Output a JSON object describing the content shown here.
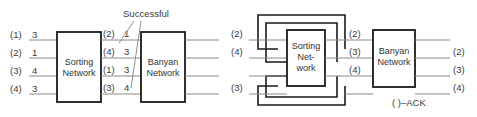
{
  "figure": {
    "name": "sorting-banyan-network-diagram",
    "panels": [
      {
        "id": "left-panel",
        "name": "non-blocking-successful-routing",
        "callout": "Successful",
        "blocks": [
          {
            "id": "sorting",
            "name": "sorting-network-block",
            "lines": [
              "Sorting",
              "Network"
            ]
          },
          {
            "id": "banyan",
            "name": "banyan-network-block",
            "lines": [
              "Banyan",
              "Network"
            ]
          }
        ],
        "input_labels": [
          {
            "port": "(1)",
            "value": "3"
          },
          {
            "port": "(2)",
            "value": "1"
          },
          {
            "port": "(3)",
            "value": "4"
          },
          {
            "port": "(4)",
            "value": "3"
          }
        ],
        "middle_labels": [
          {
            "port": "(2)",
            "value": "1"
          },
          {
            "port": "(4)",
            "value": "3"
          },
          {
            "port": "(1)",
            "value": "3"
          },
          {
            "port": "(3)",
            "value": "4"
          }
        ],
        "output_labels": [
          "",
          "",
          "",
          ""
        ]
      },
      {
        "id": "right-panel",
        "name": "blocking-with-ack-feedback",
        "callout": "( )–ACK",
        "blocks": [
          {
            "id": "sorting",
            "name": "sorting-network-block",
            "lines": [
              "Sorting",
              "Net-",
              "work"
            ]
          },
          {
            "id": "banyan",
            "name": "banyan-network-block",
            "lines": [
              "Banyan",
              "Network"
            ]
          }
        ],
        "input_labels": [
          {
            "port": "(2)",
            "value": ""
          },
          {
            "port": "(4)",
            "value": ""
          },
          {
            "port": "",
            "value": ""
          },
          {
            "port": "(3)",
            "value": ""
          }
        ],
        "middle_labels": [
          {
            "port": "(2)",
            "value": ""
          },
          {
            "port": "(3)",
            "value": ""
          },
          {
            "port": "(4)",
            "value": ""
          },
          {
            "port": "",
            "value": ""
          }
        ],
        "output_labels": [
          "",
          "(2)",
          "(3)",
          "(4)"
        ]
      }
    ],
    "colors": {
      "wire": "#8a8a8a",
      "loop": "#1a1a1a",
      "box_border": "#1a1a1a",
      "box_fill": "#ffffff",
      "text": "#3a3a3a",
      "background": "#ffffff"
    }
  }
}
